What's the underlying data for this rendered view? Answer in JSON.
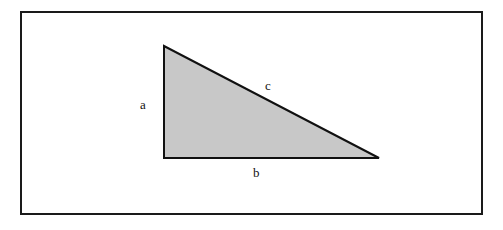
{
  "figure": {
    "type": "geometry-diagram",
    "background_color": "#ffffff",
    "frame": {
      "name": "border-frame",
      "stroke_color": "#1a1a1a",
      "stroke_width": 2,
      "x": 20,
      "y": 11,
      "width": 463,
      "height": 204
    },
    "shape": {
      "name": "right-triangle",
      "fill_color": "#c8c8c8",
      "stroke_color": "#111111",
      "stroke_width": 2,
      "vertices": [
        {
          "name": "apex",
          "x": 164,
          "y": 46
        },
        {
          "name": "bottom-left-right-angle",
          "x": 164,
          "y": 158
        },
        {
          "name": "bottom-right",
          "x": 379,
          "y": 158
        }
      ]
    },
    "labels": [
      {
        "id": "a",
        "text": "a",
        "side": "vertical-leg",
        "x": 145,
        "y": 104
      },
      {
        "id": "b",
        "text": "b",
        "side": "horizontal-leg",
        "x": 258,
        "y": 172
      },
      {
        "id": "c",
        "text": "c",
        "side": "hypotenuse",
        "x": 270,
        "y": 85
      }
    ]
  }
}
